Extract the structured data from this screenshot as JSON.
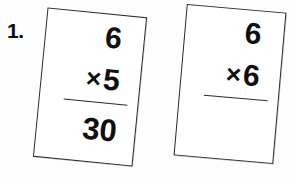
{
  "page": {
    "background_color": "#fdfdfd",
    "ink_color": "#141414",
    "width": 290,
    "height": 182
  },
  "problem": {
    "number_label": "1."
  },
  "cards": [
    {
      "id": "card-1",
      "operand_top": "6",
      "operator": "×",
      "operand_bottom": "5",
      "answer": "30",
      "answered": true,
      "rotation_deg": 5.6
    },
    {
      "id": "card-2",
      "operand_top": "6",
      "operator": "×",
      "operand_bottom": "6",
      "answer": "",
      "answered": false,
      "rotation_deg": 5.0
    }
  ]
}
